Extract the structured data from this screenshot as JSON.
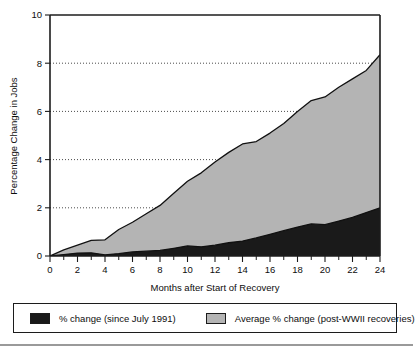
{
  "chart_data": {
    "type": "area",
    "title": "",
    "subtitle": "",
    "xlabel": "Months after Start of Recovery",
    "ylabel": "Percentage Change in Jobs",
    "xlim": [
      0,
      24
    ],
    "ylim": [
      0,
      10
    ],
    "xticks": [
      0,
      2,
      4,
      6,
      8,
      10,
      12,
      14,
      16,
      18,
      20,
      22,
      24
    ],
    "xtick_labels": [
      "0",
      "2",
      "4",
      "6",
      "8",
      "10",
      "12",
      "14",
      "16",
      "18",
      "20",
      "22",
      "24"
    ],
    "xminor_tick_interval": 1,
    "yticks": [
      0,
      2,
      4,
      6,
      8,
      10
    ],
    "ytick_labels": [
      "0",
      "2",
      "4",
      "6",
      "8",
      "10"
    ],
    "grid": "horizontal-dotted",
    "gridlines_at": [
      2,
      4,
      6,
      8
    ],
    "legend_position": "below-plot",
    "x": [
      0,
      1,
      2,
      3,
      4,
      5,
      6,
      7,
      8,
      9,
      10,
      11,
      12,
      13,
      14,
      15,
      16,
      17,
      18,
      19,
      20,
      21,
      22,
      23,
      24
    ],
    "series": [
      {
        "name": "Average % change (post-WWII recoveries)",
        "color": "#b4b4b4",
        "values": [
          0.0,
          0.25,
          0.45,
          0.65,
          0.67,
          1.1,
          1.4,
          1.75,
          2.1,
          2.6,
          3.1,
          3.45,
          3.9,
          4.3,
          4.65,
          4.75,
          5.1,
          5.5,
          6.0,
          6.45,
          6.6,
          7.0,
          7.35,
          7.7,
          8.35
        ]
      },
      {
        "name": "% change (since July 1991)",
        "color": "#1a1a1a",
        "values": [
          0.0,
          0.06,
          0.12,
          0.13,
          0.05,
          0.1,
          0.17,
          0.2,
          0.23,
          0.32,
          0.42,
          0.38,
          0.45,
          0.55,
          0.62,
          0.75,
          0.9,
          1.05,
          1.2,
          1.33,
          1.3,
          1.45,
          1.6,
          1.8,
          2.0
        ]
      }
    ]
  },
  "axes": {
    "ylabel": "Percentage Change in Jobs",
    "xlabel": "Months after Start of Recovery"
  },
  "legend": {
    "entries": [
      {
        "label": "% change (since July 1991)",
        "color": "#1a1a1a"
      },
      {
        "label": "Average % change (post-WWII recoveries)",
        "color": "#b4b4b4"
      }
    ]
  }
}
